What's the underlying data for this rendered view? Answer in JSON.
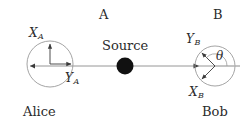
{
  "figure": {
    "type": "bell-test-epr-schematic",
    "background_color": "#ffffff",
    "stroke_color": "#7a7a7a",
    "arrow_color": "#3a3a3a",
    "text_color": "#2b2b2b",
    "source_dot_color": "#111111"
  },
  "labels": {
    "station_a": "A",
    "station_b": "B",
    "alice": "Alice",
    "bob": "Bob",
    "source": "Source",
    "x_a": "X",
    "x_a_sub": "A",
    "y_a": "Y",
    "y_a_sub": "A",
    "x_b": "X",
    "x_b_sub": "B",
    "y_b": "Y",
    "y_b_sub": "B",
    "theta": "θ"
  },
  "geometry": {
    "alice_circle": {
      "cx": 50,
      "cy": 64,
      "r": 23
    },
    "bob_circle": {
      "cx": 215,
      "cy": 66,
      "r": 20
    },
    "source_dot": {
      "cx": 125,
      "cy": 66,
      "r": 8
    },
    "beam_line": {
      "x1": 30,
      "y1": 66,
      "x2": 240,
      "y2": 66
    },
    "alice_axis_x": {
      "angle_deg": 90,
      "length": 22
    },
    "alice_axis_y": {
      "angle_deg": 0,
      "length": 22
    },
    "bob_axis_y": {
      "angle_deg": 135,
      "length": 20
    },
    "bob_axis_x": {
      "angle_deg": 225,
      "length": 20
    },
    "theta_angle_deg": 135
  }
}
